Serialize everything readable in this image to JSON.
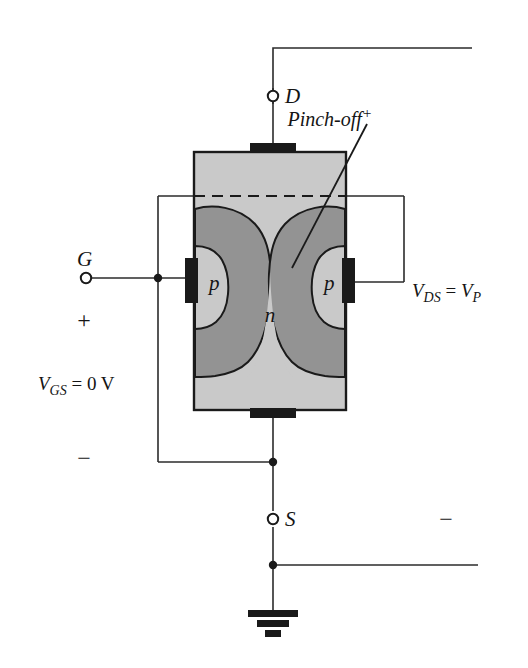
{
  "figure": {
    "kind": "n-channel-jfet-cross-section"
  },
  "labels": {
    "drain_terminal": "D",
    "source_terminal": "S",
    "gate_terminal": "G",
    "pinch_off": "Pinch-off",
    "pinch_off_sup": "+",
    "vds": "V",
    "vds_sub": "DS",
    "vds_eq": " = ",
    "vds_val": "V",
    "vds_val_sub": "P",
    "vgs": "V",
    "vgs_sub": "GS",
    "vgs_eq": " = 0 V",
    "plus_gate": "+",
    "minus_gate": "−",
    "minus_supply": "−",
    "p_left": "p",
    "p_right": "p",
    "n_channel": "n"
  },
  "colors": {
    "n_region": "#c9c9c9",
    "depletion": "#939393",
    "outline": "#1a1a1a",
    "contact": "#1a1a1a",
    "wire": "#2b2b2b",
    "background": "#ffffff",
    "text": "#141414"
  },
  "geometry": {
    "body": {
      "x": 194,
      "y": 152,
      "width": 152,
      "height": 258
    },
    "dashed_line_y": 196,
    "drain_contact": {
      "x": 250,
      "y": 144,
      "width": 46,
      "height": 10
    },
    "source_contact": {
      "x": 250,
      "y": 408,
      "width": 46,
      "height": 10
    },
    "gate_contact_left": {
      "x": 185,
      "y": 258,
      "width": 13,
      "height": 44
    },
    "gate_contact_right": {
      "x": 342,
      "y": 258,
      "width": 13,
      "height": 44
    },
    "drain_node_y": 96,
    "source_node_y": 519,
    "ground_y": 612
  }
}
